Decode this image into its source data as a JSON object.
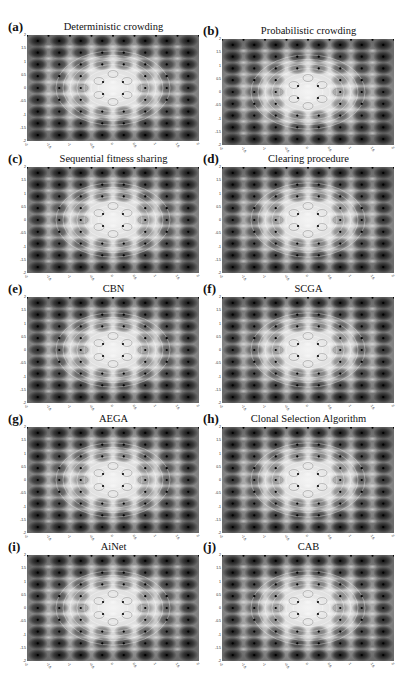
{
  "figure": {
    "panels": [
      {
        "letter": "(a)",
        "title": "Deterministic crowding"
      },
      {
        "letter": "(b)",
        "title": "Probabilistic crowding"
      },
      {
        "letter": "(c)",
        "title": "Sequential fitness sharing"
      },
      {
        "letter": "(d)",
        "title": "Clearing procedure"
      },
      {
        "letter": "(e)",
        "title": "CBN"
      },
      {
        "letter": "(f)",
        "title": "SCGA"
      },
      {
        "letter": "(g)",
        "title": "AEGA"
      },
      {
        "letter": "(h)",
        "title": "Clonal Selection Algorithm"
      },
      {
        "letter": "(i)",
        "title": "AiNet"
      },
      {
        "letter": "(j)",
        "title": "CAB"
      }
    ]
  },
  "chart_data": {
    "type": "heatmap",
    "layout": {
      "rows": 5,
      "cols": 2
    },
    "xlim": [
      -2,
      2
    ],
    "ylim": [
      -2,
      2
    ],
    "x_ticks": [
      "-2",
      "-1.5",
      "-1",
      "-0.5",
      "0",
      "0.5",
      "1",
      "1.5",
      "2"
    ],
    "y_ticks": [
      "2",
      "1.5",
      "1",
      "0.5",
      "0",
      "-0.5",
      "-1",
      "-1.5",
      "-2"
    ],
    "colormap": "grayscale (dark minima at periphery, bright center)",
    "grid": false,
    "legend": null,
    "panels": [
      {
        "label": "(a)",
        "title": "Deterministic crowding"
      },
      {
        "label": "(b)",
        "title": "Probabilistic crowding"
      },
      {
        "label": "(c)",
        "title": "Sequential fitness sharing"
      },
      {
        "label": "(d)",
        "title": "Clearing procedure"
      },
      {
        "label": "(e)",
        "title": "CBN"
      },
      {
        "label": "(f)",
        "title": "SCGA"
      },
      {
        "label": "(g)",
        "title": "AEGA"
      },
      {
        "label": "(h)",
        "title": "Clonal Selection Algorithm"
      },
      {
        "label": "(i)",
        "title": "AiNet"
      },
      {
        "label": "(j)",
        "title": "CAB"
      }
    ]
  }
}
